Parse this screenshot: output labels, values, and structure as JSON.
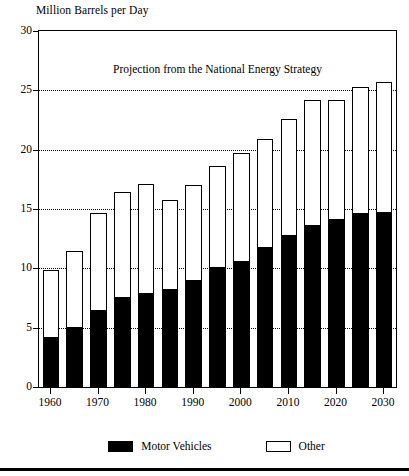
{
  "chart_data": {
    "type": "bar",
    "stacked": true,
    "title": "",
    "annotation": "Projection from the National Energy Strategy",
    "ylabel": "Million Barrels per Day",
    "xlabel": "",
    "ylim": [
      0,
      30
    ],
    "yticks": [
      0,
      5,
      10,
      15,
      20,
      25,
      30
    ],
    "gridlines": [
      5,
      10,
      15,
      20,
      25
    ],
    "grid": "horizontal-dotted",
    "legend_position": "bottom",
    "categories": [
      "1960",
      "1965",
      "1970",
      "1975",
      "1980",
      "1985",
      "1990",
      "1995",
      "2000",
      "2005",
      "2010",
      "2015",
      "2020",
      "2025",
      "2030"
    ],
    "xtick_labels": [
      "1960",
      "1970",
      "1980",
      "1990",
      "2000",
      "2010",
      "2020",
      "2030"
    ],
    "series": [
      {
        "name": "Motor Vehicles",
        "color": "#000000",
        "values": [
          4.1,
          5.0,
          6.4,
          7.5,
          7.8,
          8.2,
          8.9,
          10.0,
          10.5,
          11.7,
          12.7,
          13.6,
          14.1,
          14.6,
          14.7
        ]
      },
      {
        "name": "Other",
        "color": "#ffffff",
        "values": [
          5.8,
          6.5,
          8.3,
          8.9,
          9.3,
          7.6,
          8.1,
          8.6,
          9.2,
          9.2,
          9.9,
          10.6,
          10.1,
          10.7,
          11.0
        ]
      }
    ],
    "totals": [
      9.9,
      11.5,
      14.7,
      16.4,
      17.1,
      15.8,
      17.0,
      18.6,
      19.7,
      20.9,
      22.6,
      24.2,
      24.2,
      25.3,
      25.7
    ]
  },
  "legend": {
    "items": [
      {
        "label": "Motor Vehicles",
        "style": "filled"
      },
      {
        "label": "Other",
        "style": "hollow"
      }
    ]
  }
}
